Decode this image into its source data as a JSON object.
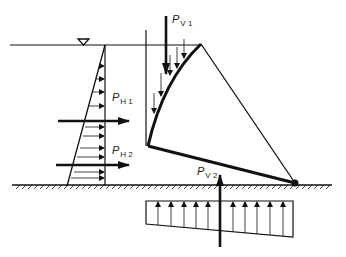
{
  "diagram": {
    "labels": {
      "ph1": {
        "main": "P",
        "sub": "H 1"
      },
      "ph2": {
        "main": "P",
        "sub": "H 2"
      },
      "pv1": {
        "main": "P",
        "sub": "V 1"
      },
      "pv2": {
        "main": "P",
        "sub": "V 2"
      }
    },
    "elements": [
      "water-surface-line",
      "water-level-triangle-symbol",
      "horizontal-pressure-triangle",
      "sector-gate-curved-face",
      "gate-pivot",
      "ground-line-hatched",
      "uplift-pressure-trapezoid"
    ],
    "colors": {
      "ink": "#111111",
      "background": "#ffffff"
    }
  }
}
